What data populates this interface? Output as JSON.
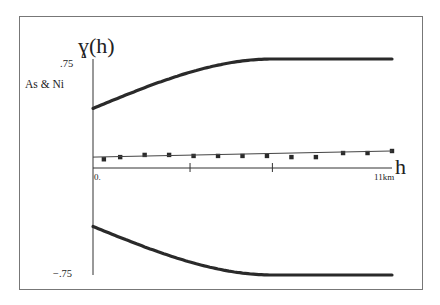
{
  "chart_data": {
    "type": "line",
    "title": "ɣ(h)",
    "series_label": "As & Ni",
    "xlabel": "h",
    "ylabel": "ɣ(h)",
    "xlim": [
      0,
      11
    ],
    "ylim": [
      -0.75,
      0.75
    ],
    "x_tick_labels": [
      {
        "x": 0,
        "label": "0."
      },
      {
        "x": 11,
        "label": "11km"
      }
    ],
    "x_minor_ticks": [
      3.57,
      6.6
    ],
    "y_tick_labels": [
      {
        "y": 0.75,
        "label": ".75"
      },
      {
        "y": -0.75,
        "label": "−.75"
      }
    ],
    "grid": false,
    "series": [
      {
        "name": "upper envelope",
        "style": "thick-line",
        "model": "spherical",
        "nugget": 0.41,
        "sill": 0.75,
        "range": 6.6,
        "x": [
          0,
          0.5,
          1,
          1.5,
          2,
          2.5,
          3,
          3.5,
          4,
          4.5,
          5,
          5.5,
          6,
          6.6,
          7,
          8,
          9,
          10,
          11
        ],
        "values": [
          0.41,
          0.449,
          0.487,
          0.524,
          0.56,
          0.594,
          0.626,
          0.655,
          0.681,
          0.703,
          0.721,
          0.736,
          0.746,
          0.75,
          0.75,
          0.75,
          0.75,
          0.75,
          0.75
        ]
      },
      {
        "name": "lower envelope",
        "style": "thick-line",
        "model": "spherical",
        "nugget": -0.41,
        "sill": -0.75,
        "range": 6.6,
        "x": [
          0,
          0.5,
          1,
          1.5,
          2,
          2.5,
          3,
          3.5,
          4,
          4.5,
          5,
          5.5,
          6,
          6.6,
          7,
          8,
          9,
          10,
          11
        ],
        "values": [
          -0.41,
          -0.449,
          -0.487,
          -0.524,
          -0.56,
          -0.594,
          -0.626,
          -0.655,
          -0.681,
          -0.703,
          -0.721,
          -0.736,
          -0.746,
          -0.75,
          -0.75,
          -0.75,
          -0.75,
          -0.75,
          -0.75
        ]
      },
      {
        "name": "experimental cross-variogram",
        "style": "markers",
        "marker": "square",
        "x": [
          0.4,
          1.0,
          1.9,
          2.8,
          3.7,
          4.6,
          5.5,
          6.4,
          7.3,
          8.2,
          9.2,
          10.1,
          11.0
        ],
        "values": [
          0.06,
          0.075,
          0.09,
          0.09,
          0.083,
          0.083,
          0.083,
          0.083,
          0.075,
          0.075,
          0.103,
          0.103,
          0.117
        ]
      },
      {
        "name": "fitted model",
        "style": "thin-line",
        "x": [
          0,
          11
        ],
        "values": [
          0.075,
          0.117
        ]
      }
    ]
  }
}
